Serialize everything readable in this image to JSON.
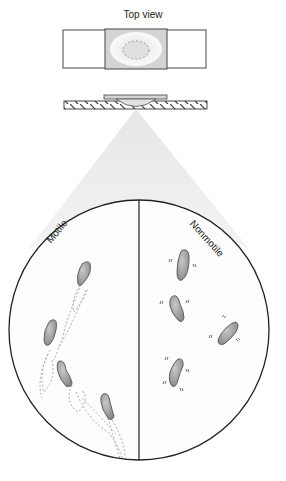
{
  "diagram": {
    "title": "Top view",
    "views": {
      "top_view": {
        "label": "Top view",
        "parts": [
          "slide",
          "coverslip",
          "depression-well",
          "drop"
        ]
      },
      "side_view": {
        "parts": [
          "slide-hatched",
          "coverslip",
          "hanging-drop"
        ]
      },
      "magnified_field": {
        "left_panel": {
          "label": "Motile",
          "cells": 4,
          "trails": "dashed"
        },
        "right_panel": {
          "label": "Nonmotile",
          "cells": 4,
          "marks": "vibration ticks"
        }
      }
    },
    "colors": {
      "cell_fill": "#9a9a9a",
      "cell_stroke": "#555555",
      "coverslip_fill": "#d6d6d6",
      "cone_fill": "#ececec",
      "outline": "#222222"
    }
  }
}
